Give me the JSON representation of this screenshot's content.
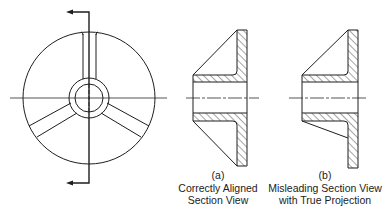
{
  "figure": {
    "left_view": {
      "label": "Front view with cutting plane",
      "rib_count": 3
    },
    "view_a": {
      "letter": "(a)",
      "title_line1": "Correctly Aligned",
      "title_line2": "Section View"
    },
    "view_b": {
      "letter": "(b)",
      "title_line1": "Misleading Section View",
      "title_line2": "with True Projection"
    }
  },
  "colors": {
    "line": "#1e1e1e",
    "background": "#ffffff"
  }
}
